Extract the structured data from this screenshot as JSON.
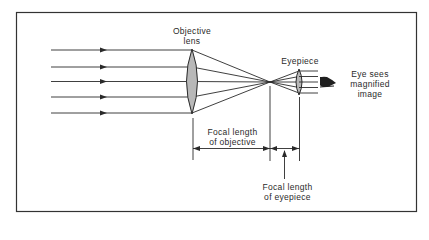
{
  "diagram": {
    "type": "optical ray diagram (refracting telescope / compound lens)",
    "labels": {
      "objective_line1": "Objective",
      "objective_line2": "lens",
      "eyepiece": "Eyepiece",
      "eye_line1": "Eye sees",
      "eye_line2": "magnified",
      "eye_line3": "image",
      "focal_objective_line1": "Focal length",
      "focal_objective_line2": "of objective",
      "focal_eyepiece_line1": "Focal length",
      "focal_eyepiece_line2": "of eyepiece"
    },
    "elements": [
      {
        "id": "incoming-rays",
        "count": 5,
        "description": "parallel rays with direction arrows"
      },
      {
        "id": "objective-lens",
        "shape": "biconvex",
        "fill": "#b8b8b8"
      },
      {
        "id": "focal-point",
        "description": "rays converge and cross"
      },
      {
        "id": "eyepiece-lens",
        "shape": "biconvex",
        "fill": "#b8b8b8"
      },
      {
        "id": "outgoing-rays",
        "count": 5,
        "description": "parallel rays to the eye"
      },
      {
        "id": "eye-icon"
      }
    ],
    "colors": {
      "line": "#2a2a2a",
      "lens_fill": "#b8b8b8",
      "frame": "#333333",
      "background": "#ffffff"
    }
  }
}
